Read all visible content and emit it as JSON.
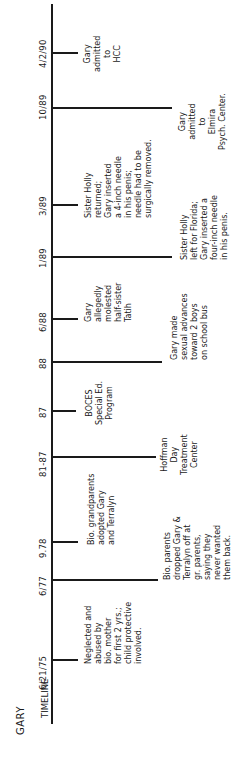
{
  "header": {
    "title": "GARY",
    "axis_label": "TIMELINE"
  },
  "events": [
    {
      "date": "6/21/75",
      "text": "Neglected and\nabused by\nbio. mother\nfor first 2 yrs.;\nchild protective\ninvolved.",
      "side": "short"
    },
    {
      "date": "6/77",
      "text": "Bio. parents\ndropped Gary &\nTerralyn off at\ngr. parents,\nsaying they\nnever wanted\nthem back.",
      "side": "long"
    },
    {
      "date": "9.78",
      "text": "Bio. grandparents\nadopted Gary\nand Terralyn",
      "side": "short"
    },
    {
      "date": "81-87",
      "text": "Hoffman\nDay\nTreatment\nCenter",
      "side": "long"
    },
    {
      "date": "87",
      "text": "BOCES\nSpecial Ed.\nProgram",
      "side": "short"
    },
    {
      "date": "88",
      "text": "Gary made\nsexual advances\ntoward 2 boys\non school bus",
      "side": "long"
    },
    {
      "date": "6/88",
      "text": "Gary\nallegedly\nmolested\nhalf-sister\nTatih",
      "side": "short"
    },
    {
      "date": "1/89",
      "text": "Sister Holly\nleft for Florida;\nGary inserted a\nfour-inch needle\nin his penis.",
      "side": "long"
    },
    {
      "date": "3/89",
      "text": "Sister Holly\nreturned;\nGary inserted\na 4-inch needle\nin his penis;\nneedle had to be\nsurgically removed.",
      "side": "short"
    },
    {
      "date": "10/89",
      "text": "Gary\nadmitted\nto\nElmira\nPsych. Center.",
      "side": "long"
    },
    {
      "date": "4/2/90",
      "text": "Gary\nadmitted\nto\nHCC",
      "side": "short"
    }
  ]
}
